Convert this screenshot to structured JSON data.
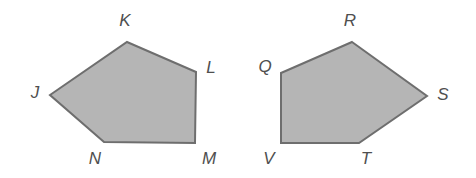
{
  "figure": {
    "background_color": "#ffffff",
    "fill_color": "#b5b5b5",
    "stroke_color": "#6e6e6e",
    "stroke_width": 2,
    "label_color": "#4f4f4f",
    "label_font_size": 17
  },
  "shapes": [
    {
      "id": "pentagon-jklmn",
      "name": "pentagon-jklmn",
      "sides": 5,
      "points": "127,42 196,72 195,143 104,142 50,95",
      "vertices": [
        {
          "id": "K",
          "label": "K",
          "x": 127,
          "y": 42,
          "label_x": 125,
          "label_y": 22
        },
        {
          "id": "L",
          "label": "L",
          "x": 196,
          "y": 72,
          "label_x": 211,
          "label_y": 69
        },
        {
          "id": "M",
          "label": "M",
          "x": 195,
          "y": 143,
          "label_x": 209,
          "label_y": 160
        },
        {
          "id": "N",
          "label": "N",
          "x": 104,
          "y": 142,
          "label_x": 95,
          "label_y": 160
        },
        {
          "id": "J",
          "label": "J",
          "x": 50,
          "y": 95,
          "label_x": 35,
          "label_y": 94
        }
      ]
    },
    {
      "id": "pentagon-qrstv",
      "name": "pentagon-qrstv",
      "sides": 5,
      "points": "352,42 427,96 359,143 281,143 281,73",
      "vertices": [
        {
          "id": "R",
          "label": "R",
          "x": 352,
          "y": 42,
          "label_x": 350,
          "label_y": 22
        },
        {
          "id": "S",
          "label": "S",
          "x": 427,
          "y": 96,
          "label_x": 443,
          "label_y": 96
        },
        {
          "id": "T",
          "label": "T",
          "x": 359,
          "y": 143,
          "label_x": 366,
          "label_y": 160
        },
        {
          "id": "V",
          "label": "V",
          "x": 281,
          "y": 143,
          "label_x": 269,
          "label_y": 160
        },
        {
          "id": "Q",
          "label": "Q",
          "x": 281,
          "y": 73,
          "label_x": 265,
          "label_y": 68
        }
      ]
    }
  ]
}
